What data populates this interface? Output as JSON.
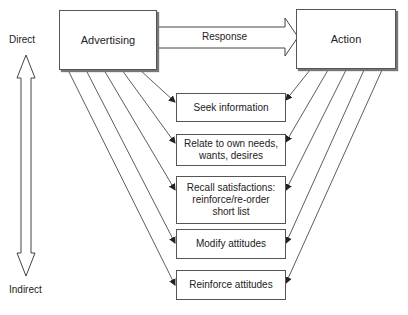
{
  "diagram": {
    "source_node": "Advertising",
    "target_node": "Action",
    "main_arrow_label": "Response",
    "scale": {
      "top_label": "Direct",
      "bottom_label": "Indirect"
    },
    "intermediate_steps": [
      {
        "label": "Seek information"
      },
      {
        "label": "Relate to own needs,\nwants, desires"
      },
      {
        "label": "Recall satisfactions:\nreinforce/re-order\nshort list"
      },
      {
        "label": "Modify attitudes"
      },
      {
        "label": "Reinforce attitudes"
      }
    ]
  }
}
